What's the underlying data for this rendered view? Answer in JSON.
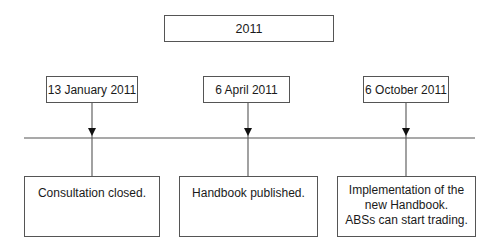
{
  "title": "2011",
  "timeline": {
    "milestones": [
      {
        "date": "13 January 2011",
        "event_lines": [
          "Consultation closed."
        ]
      },
      {
        "date": "6 April 2011",
        "event_lines": [
          "Handbook published."
        ]
      },
      {
        "date": "6 October 2011",
        "event_lines": [
          "Implementation of the",
          "new Handbook.",
          "ABSs can start trading."
        ]
      }
    ]
  },
  "colors": {
    "line": "#555555",
    "arrow": "#111111",
    "text": "#1a1a1a"
  }
}
